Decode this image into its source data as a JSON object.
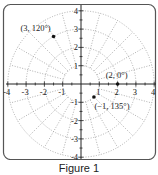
{
  "figure": {
    "caption": "Figure 1",
    "type": "polar-coordinate-grid"
  },
  "grid": {
    "max_radius": 4,
    "circle_radii": [
      1,
      2,
      3,
      4
    ],
    "ray_step_degrees": 15,
    "rays_start_radius": 1,
    "grid_style": "dotted"
  },
  "axes": {
    "x_ticks": [
      -4,
      -3,
      -2,
      -1,
      1,
      2,
      3,
      4
    ],
    "y_ticks": [
      4,
      3,
      2,
      1,
      -1,
      -2,
      -3,
      -4
    ],
    "x_tick_labels": [
      "-4",
      "-3",
      "-2",
      "-1",
      "1",
      "2",
      "3",
      "4"
    ],
    "y_tick_labels": [
      "4",
      "3",
      "2",
      "1",
      "-1",
      "-2",
      "-3",
      "-4"
    ],
    "minor_tick_step": 0.5
  },
  "points": [
    {
      "label": "(3, 120°)",
      "r": 3,
      "theta_deg": 120
    },
    {
      "label": "(2, 0°)",
      "r": 2,
      "theta_deg": 0
    },
    {
      "label": "(−1, 135°)",
      "r": -1,
      "theta_deg": 135
    }
  ],
  "colors": {
    "axis": "#222222",
    "grid": "#9a9a9a",
    "border": "#555555",
    "point": "#111111"
  }
}
